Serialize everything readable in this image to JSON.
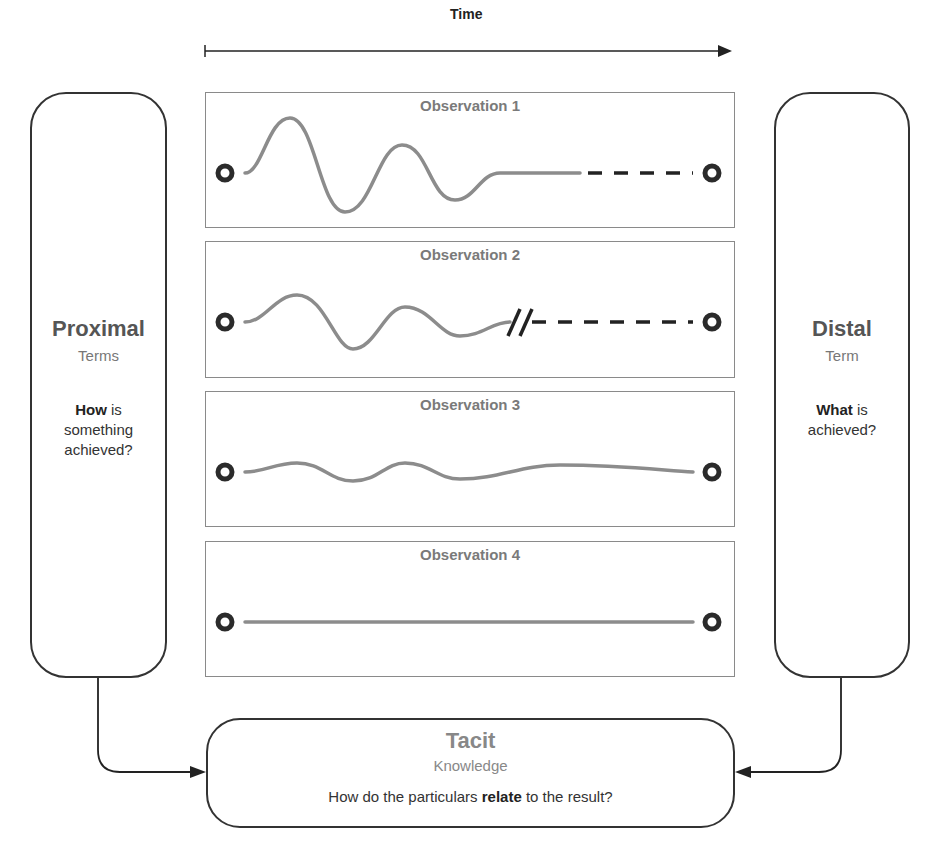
{
  "timeline": {
    "label": "Time"
  },
  "observations": [
    {
      "title": "Observation 1",
      "pattern": "large-damped-oscillation-then-flat",
      "ending": "dashed"
    },
    {
      "title": "Observation 2",
      "pattern": "medium-damped-oscillation",
      "ending": "break-then-dashed"
    },
    {
      "title": "Observation 3",
      "pattern": "small-oscillation",
      "ending": "solid"
    },
    {
      "title": "Observation 4",
      "pattern": "flat-line",
      "ending": "solid"
    }
  ],
  "proximal": {
    "title": "Proximal",
    "subtitle": "Terms",
    "question_bold": "How",
    "question_rest_1": " is",
    "question_line_2": "something",
    "question_line_3": "achieved?"
  },
  "distal": {
    "title": "Distal",
    "subtitle": "Term",
    "question_bold": "What",
    "question_rest_1": " is",
    "question_line_2": "achieved?"
  },
  "tacit": {
    "title": "Tacit",
    "subtitle": "Knowledge",
    "question_pre": "How do the particulars ",
    "question_bold": "relate",
    "question_post": " to the result?"
  },
  "icons": {
    "endpoint": "ring-endpoint-icon",
    "arrow": "arrowhead-icon",
    "break": "break-mark-icon"
  },
  "colors": {
    "wave": "#8c8c8c",
    "endpoint": "#2b2b2b",
    "box_border": "#333333",
    "obs_border": "#8a8a8a",
    "title_gray": "#7a7a7a"
  }
}
